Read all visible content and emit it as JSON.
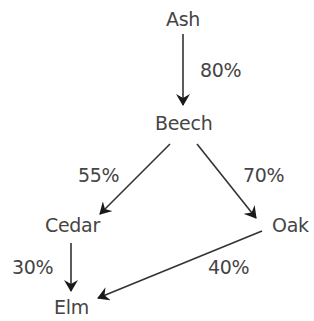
{
  "diagram": {
    "type": "directed-flow",
    "nodes": [
      {
        "id": "ash",
        "label": "Ash"
      },
      {
        "id": "beech",
        "label": "Beech"
      },
      {
        "id": "cedar",
        "label": "Cedar"
      },
      {
        "id": "oak",
        "label": "Oak"
      },
      {
        "id": "elm",
        "label": "Elm"
      }
    ],
    "edges": [
      {
        "from": "Ash",
        "to": "Beech",
        "label": "80%"
      },
      {
        "from": "Beech",
        "to": "Cedar",
        "label": "55%"
      },
      {
        "from": "Beech",
        "to": "Oak",
        "label": "70%"
      },
      {
        "from": "Cedar",
        "to": "Elm",
        "label": "30%"
      },
      {
        "from": "Oak",
        "to": "Elm",
        "label": "40%"
      }
    ],
    "colors": {
      "text": "#454545",
      "arrow": "#222222",
      "background": "#ffffff"
    }
  }
}
